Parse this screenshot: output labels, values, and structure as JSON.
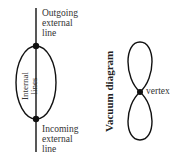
{
  "figure": {
    "left_diagram": {
      "outgoing_label": [
        "Outgoing",
        "external",
        "line"
      ],
      "incoming_label": [
        "Incoming",
        "external",
        "line"
      ],
      "internal_label": [
        "Internal",
        "lines"
      ]
    },
    "right_diagram": {
      "title": "Vacuum diagram",
      "vertex_label": "vertex"
    }
  }
}
